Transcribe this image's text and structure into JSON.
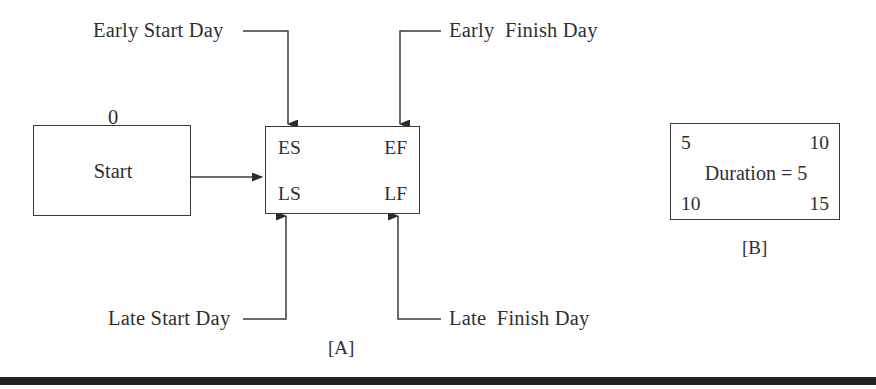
{
  "figure": {
    "background_color": "#ffffff",
    "line_color": "#3a3a3a",
    "text_color": "#2f2f2f",
    "bottom_bar_color": "#232323"
  },
  "panel_a": {
    "caption": "[A]",
    "start_node": {
      "label": "Start",
      "above_value": "0"
    },
    "activity_node": {
      "early_start_code": "ES",
      "early_finish_code": "EF",
      "late_start_code": "LS",
      "late_finish_code": "LF"
    },
    "callouts": [
      {
        "id": "early-start-day",
        "text": "Early Start Day"
      },
      {
        "id": "early-finish-day",
        "text": "Early  Finish Day"
      },
      {
        "id": "late-start-day",
        "text": "Late Start Day"
      },
      {
        "id": "late-finish-day",
        "text": "Late  Finish Day"
      }
    ]
  },
  "panel_b": {
    "caption": "[B]",
    "node": {
      "early_start": "5",
      "early_finish": "10",
      "duration_text": "Duration = 5",
      "late_start": "10",
      "late_finish": "15"
    }
  }
}
